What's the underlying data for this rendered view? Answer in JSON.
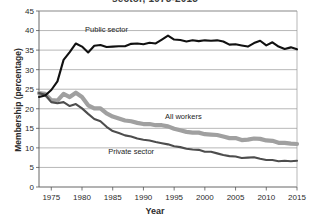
{
  "chart_data": {
    "type": "line",
    "title": "sector, 1973-2015",
    "xlabel": "Year",
    "ylabel": "Membership (percentage)",
    "xlim": [
      1973,
      2015
    ],
    "ylim": [
      0,
      45
    ],
    "ytick_step": 5,
    "xtick_step": 5,
    "grid": true,
    "legend_position": "inline-annotations",
    "xticks": [
      1975,
      1980,
      1985,
      1990,
      1995,
      2000,
      2005,
      2010,
      2015
    ],
    "yticks": [
      0,
      5,
      10,
      15,
      20,
      25,
      30,
      35,
      40,
      45
    ],
    "x": [
      1973,
      1974,
      1975,
      1976,
      1977,
      1978,
      1979,
      1980,
      1981,
      1982,
      1983,
      1984,
      1985,
      1986,
      1987,
      1988,
      1989,
      1990,
      1991,
      1992,
      1993,
      1994,
      1995,
      1996,
      1997,
      1998,
      1999,
      2000,
      2001,
      2002,
      2003,
      2004,
      2005,
      2006,
      2007,
      2008,
      2009,
      2010,
      2011,
      2012,
      2013,
      2014,
      2015
    ],
    "series": [
      {
        "name": "Public sector",
        "color": "#111111",
        "width": 2.1,
        "label_x": 1984.0,
        "label_y": 39.6,
        "values": [
          23.0,
          23.4,
          24.8,
          27.0,
          32.5,
          34.5,
          36.7,
          35.9,
          34.4,
          36.1,
          36.3,
          35.8,
          35.9,
          36.0,
          36.0,
          36.6,
          36.7,
          36.5,
          36.9,
          36.7,
          37.7,
          38.7,
          37.7,
          37.6,
          37.2,
          37.5,
          37.3,
          37.5,
          37.4,
          37.5,
          37.2,
          36.4,
          36.5,
          36.2,
          35.9,
          36.8,
          37.4,
          36.2,
          37.0,
          35.9,
          35.3,
          35.7,
          35.2
        ]
      },
      {
        "name": "All workers",
        "color": "#a0a0a0",
        "width": 4.2,
        "label_x": 1996.5,
        "label_y": 17.3,
        "values": [
          24.0,
          23.8,
          22.2,
          22.1,
          23.8,
          23.0,
          24.1,
          23.0,
          20.9,
          20.1,
          20.1,
          18.8,
          18.0,
          17.5,
          17.0,
          16.8,
          16.4,
          16.1,
          16.1,
          15.8,
          15.8,
          15.5,
          14.9,
          14.5,
          14.1,
          13.9,
          13.9,
          13.5,
          13.4,
          13.3,
          12.9,
          12.5,
          12.5,
          12.0,
          12.1,
          12.4,
          12.3,
          11.9,
          11.8,
          11.3,
          11.3,
          11.1,
          11.0
        ]
      },
      {
        "name": "Private sector",
        "color": "#4d4d4d",
        "width": 2.1,
        "label_x": 1988.0,
        "label_y": 8.5,
        "values": [
          24.0,
          23.6,
          21.7,
          21.4,
          21.7,
          20.7,
          21.2,
          20.1,
          18.7,
          17.4,
          16.8,
          15.4,
          14.3,
          13.8,
          13.2,
          12.9,
          12.4,
          12.1,
          11.9,
          11.5,
          11.2,
          10.9,
          10.4,
          10.2,
          9.8,
          9.6,
          9.5,
          9.0,
          9.0,
          8.6,
          8.2,
          7.9,
          7.8,
          7.4,
          7.5,
          7.6,
          7.2,
          6.9,
          6.9,
          6.6,
          6.7,
          6.6,
          6.7
        ]
      }
    ]
  },
  "axis": {
    "y_axis_title": "Membership (percentage)",
    "x_axis_title": "Year"
  }
}
